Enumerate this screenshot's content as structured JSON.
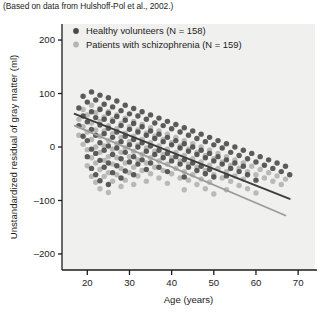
{
  "caption": "(Based on data from Hulshoff-Pol et al., 2002.)",
  "colors": {
    "healthy": "#4a4a4a",
    "patients": "#b4b4b4",
    "healthy_line": "#3d3d3d",
    "patients_line": "#9b9b9b",
    "axis": "#1c1c1c",
    "plot_background": "#f0f0ee",
    "page_background": "#ffffff"
  },
  "chart_data": {
    "type": "scatter",
    "title": "",
    "xlabel": "Age (years)",
    "ylabel": "Unstandardized residual of gray matter (ml)",
    "xlim": [
      14,
      74
    ],
    "ylim": [
      -230,
      230
    ],
    "xticks": [
      20,
      30,
      40,
      50,
      60,
      70
    ],
    "yticks": [
      200,
      100,
      0,
      -100,
      -200
    ],
    "xtick_labels": [
      "20",
      "30",
      "40",
      "50",
      "60",
      "70"
    ],
    "ytick_labels": [
      "200",
      "100",
      "0",
      "-100",
      "-200"
    ],
    "grid": false,
    "legend_position": "top-left",
    "series": [
      {
        "name": "Healthy volunteers (N = 158)",
        "color": "#4a4a4a",
        "marker": "circle",
        "n": 158,
        "trendline": {
          "x0": 17,
          "y0": 62,
          "x1": 68,
          "y1": -97
        },
        "points": [
          [
            18,
            73
          ],
          [
            18,
            40
          ],
          [
            19,
            95
          ],
          [
            19,
            58
          ],
          [
            19,
            20
          ],
          [
            20,
            84
          ],
          [
            20,
            47
          ],
          [
            20,
            12
          ],
          [
            20,
            -18
          ],
          [
            21,
            103
          ],
          [
            21,
            66
          ],
          [
            21,
            33
          ],
          [
            21,
            -4
          ],
          [
            21,
            -40
          ],
          [
            22,
            88
          ],
          [
            22,
            55
          ],
          [
            22,
            22
          ],
          [
            22,
            -12
          ],
          [
            22,
            -52
          ],
          [
            23,
            97
          ],
          [
            23,
            70
          ],
          [
            23,
            41
          ],
          [
            23,
            8
          ],
          [
            23,
            -25
          ],
          [
            23,
            -63
          ],
          [
            24,
            80
          ],
          [
            24,
            52
          ],
          [
            24,
            25
          ],
          [
            24,
            -6
          ],
          [
            24,
            -38
          ],
          [
            25,
            92
          ],
          [
            25,
            63
          ],
          [
            25,
            35
          ],
          [
            25,
            2
          ],
          [
            25,
            -30
          ],
          [
            25,
            -70
          ],
          [
            26,
            75
          ],
          [
            26,
            48
          ],
          [
            26,
            18
          ],
          [
            26,
            -14
          ],
          [
            26,
            -48
          ],
          [
            27,
            86
          ],
          [
            27,
            57
          ],
          [
            27,
            28
          ],
          [
            27,
            -2
          ],
          [
            27,
            -35
          ],
          [
            28,
            68
          ],
          [
            28,
            40
          ],
          [
            28,
            10
          ],
          [
            28,
            -22
          ],
          [
            28,
            -58
          ],
          [
            29,
            78
          ],
          [
            29,
            50
          ],
          [
            29,
            20
          ],
          [
            29,
            -10
          ],
          [
            29,
            -45
          ],
          [
            30,
            62
          ],
          [
            30,
            33
          ],
          [
            30,
            4
          ],
          [
            30,
            -28
          ],
          [
            31,
            72
          ],
          [
            31,
            44
          ],
          [
            31,
            14
          ],
          [
            31,
            -18
          ],
          [
            31,
            -52
          ],
          [
            32,
            58
          ],
          [
            32,
            28
          ],
          [
            32,
            0
          ],
          [
            32,
            -32
          ],
          [
            33,
            66
          ],
          [
            33,
            38
          ],
          [
            33,
            8
          ],
          [
            33,
            -24
          ],
          [
            34,
            52
          ],
          [
            34,
            22
          ],
          [
            34,
            -8
          ],
          [
            34,
            -42
          ],
          [
            35,
            60
          ],
          [
            35,
            30
          ],
          [
            35,
            2
          ],
          [
            35,
            -30
          ],
          [
            36,
            45
          ],
          [
            36,
            16
          ],
          [
            36,
            -14
          ],
          [
            37,
            54
          ],
          [
            37,
            24
          ],
          [
            37,
            -6
          ],
          [
            37,
            -38
          ],
          [
            38,
            40
          ],
          [
            38,
            10
          ],
          [
            38,
            -20
          ],
          [
            39,
            48
          ],
          [
            39,
            18
          ],
          [
            39,
            -12
          ],
          [
            39,
            -46
          ],
          [
            40,
            34
          ],
          [
            40,
            4
          ],
          [
            40,
            -26
          ],
          [
            41,
            42
          ],
          [
            41,
            12
          ],
          [
            41,
            -18
          ],
          [
            42,
            28
          ],
          [
            42,
            -2
          ],
          [
            42,
            -32
          ],
          [
            43,
            36
          ],
          [
            43,
            6
          ],
          [
            43,
            -24
          ],
          [
            43,
            -56
          ],
          [
            44,
            22
          ],
          [
            44,
            -8
          ],
          [
            44,
            -38
          ],
          [
            45,
            30
          ],
          [
            45,
            0
          ],
          [
            45,
            -30
          ],
          [
            46,
            16
          ],
          [
            46,
            -14
          ],
          [
            46,
            -44
          ],
          [
            47,
            24
          ],
          [
            47,
            -6
          ],
          [
            47,
            -36
          ],
          [
            48,
            10
          ],
          [
            48,
            -20
          ],
          [
            48,
            -50
          ],
          [
            49,
            18
          ],
          [
            49,
            -12
          ],
          [
            49,
            -42
          ],
          [
            50,
            4
          ],
          [
            50,
            -26
          ],
          [
            50,
            -56
          ],
          [
            51,
            12
          ],
          [
            51,
            -18
          ],
          [
            52,
            -2
          ],
          [
            52,
            -32
          ],
          [
            53,
            6
          ],
          [
            53,
            -24
          ],
          [
            53,
            -54
          ],
          [
            54,
            -10
          ],
          [
            54,
            -40
          ],
          [
            55,
            0
          ],
          [
            55,
            -30
          ],
          [
            56,
            -16
          ],
          [
            56,
            -46
          ],
          [
            57,
            -6
          ],
          [
            57,
            -36
          ],
          [
            58,
            -22
          ],
          [
            58,
            -52
          ],
          [
            59,
            -12
          ],
          [
            60,
            -28
          ],
          [
            60,
            -62
          ],
          [
            61,
            -18
          ],
          [
            62,
            -34
          ],
          [
            63,
            -24
          ],
          [
            64,
            -40
          ],
          [
            65,
            -30
          ],
          [
            66,
            -46
          ],
          [
            67,
            -36
          ],
          [
            68,
            -52
          ]
        ]
      },
      {
        "name": "Patients with schizophrenia (N = 159)",
        "color": "#b4b4b4",
        "marker": "circle",
        "n": 159,
        "trendline": {
          "x0": 17,
          "y0": 40,
          "x1": 67,
          "y1": -128
        },
        "points": [
          [
            18,
            52
          ],
          [
            18,
            22
          ],
          [
            19,
            70
          ],
          [
            19,
            38
          ],
          [
            19,
            5
          ],
          [
            20,
            60
          ],
          [
            20,
            28
          ],
          [
            20,
            -5
          ],
          [
            20,
            -35
          ],
          [
            21,
            78
          ],
          [
            21,
            45
          ],
          [
            21,
            14
          ],
          [
            21,
            -20
          ],
          [
            21,
            -55
          ],
          [
            22,
            64
          ],
          [
            22,
            32
          ],
          [
            22,
            0
          ],
          [
            22,
            -30
          ],
          [
            22,
            -66
          ],
          [
            23,
            72
          ],
          [
            23,
            48
          ],
          [
            23,
            20
          ],
          [
            23,
            -10
          ],
          [
            23,
            -42
          ],
          [
            23,
            -78
          ],
          [
            24,
            56
          ],
          [
            24,
            30
          ],
          [
            24,
            2
          ],
          [
            24,
            -25
          ],
          [
            24,
            -55
          ],
          [
            25,
            66
          ],
          [
            25,
            40
          ],
          [
            25,
            12
          ],
          [
            25,
            -18
          ],
          [
            25,
            -48
          ],
          [
            25,
            -85
          ],
          [
            26,
            52
          ],
          [
            26,
            25
          ],
          [
            26,
            -4
          ],
          [
            26,
            -32
          ],
          [
            26,
            -64
          ],
          [
            27,
            60
          ],
          [
            27,
            34
          ],
          [
            27,
            6
          ],
          [
            27,
            -20
          ],
          [
            27,
            -52
          ],
          [
            28,
            44
          ],
          [
            28,
            18
          ],
          [
            28,
            -10
          ],
          [
            28,
            -40
          ],
          [
            28,
            -74
          ],
          [
            29,
            54
          ],
          [
            29,
            26
          ],
          [
            29,
            -2
          ],
          [
            29,
            -30
          ],
          [
            29,
            -62
          ],
          [
            30,
            38
          ],
          [
            30,
            10
          ],
          [
            30,
            -18
          ],
          [
            30,
            -48
          ],
          [
            31,
            48
          ],
          [
            31,
            20
          ],
          [
            31,
            -8
          ],
          [
            31,
            -38
          ],
          [
            31,
            -70
          ],
          [
            32,
            32
          ],
          [
            32,
            4
          ],
          [
            32,
            -24
          ],
          [
            32,
            -54
          ],
          [
            33,
            42
          ],
          [
            33,
            14
          ],
          [
            33,
            -14
          ],
          [
            33,
            -44
          ],
          [
            34,
            26
          ],
          [
            34,
            -2
          ],
          [
            34,
            -30
          ],
          [
            34,
            -64
          ],
          [
            35,
            36
          ],
          [
            35,
            8
          ],
          [
            35,
            -20
          ],
          [
            35,
            -50
          ],
          [
            36,
            20
          ],
          [
            36,
            -8
          ],
          [
            36,
            -38
          ],
          [
            37,
            30
          ],
          [
            37,
            2
          ],
          [
            37,
            -26
          ],
          [
            37,
            -58
          ],
          [
            38,
            14
          ],
          [
            38,
            -14
          ],
          [
            38,
            -44
          ],
          [
            39,
            24
          ],
          [
            39,
            -4
          ],
          [
            39,
            -32
          ],
          [
            39,
            -68
          ],
          [
            40,
            8
          ],
          [
            40,
            -20
          ],
          [
            40,
            -50
          ],
          [
            41,
            18
          ],
          [
            41,
            -10
          ],
          [
            41,
            -40
          ],
          [
            42,
            2
          ],
          [
            42,
            -26
          ],
          [
            42,
            -58
          ],
          [
            43,
            12
          ],
          [
            43,
            -16
          ],
          [
            43,
            -46
          ],
          [
            43,
            -80
          ],
          [
            44,
            -4
          ],
          [
            44,
            -32
          ],
          [
            44,
            -62
          ],
          [
            45,
            6
          ],
          [
            45,
            -22
          ],
          [
            45,
            -52
          ],
          [
            46,
            -10
          ],
          [
            46,
            -38
          ],
          [
            46,
            -70
          ],
          [
            47,
            0
          ],
          [
            47,
            -28
          ],
          [
            47,
            -60
          ],
          [
            48,
            -16
          ],
          [
            48,
            -44
          ],
          [
            48,
            -78
          ],
          [
            49,
            -6
          ],
          [
            49,
            -34
          ],
          [
            49,
            -66
          ],
          [
            50,
            -22
          ],
          [
            50,
            -52
          ],
          [
            50,
            -88
          ],
          [
            51,
            -12
          ],
          [
            51,
            -40
          ],
          [
            52,
            -28
          ],
          [
            52,
            -58
          ],
          [
            53,
            -18
          ],
          [
            53,
            -46
          ],
          [
            53,
            -80
          ],
          [
            54,
            -34
          ],
          [
            54,
            -64
          ],
          [
            55,
            -24
          ],
          [
            55,
            -54
          ],
          [
            56,
            -40
          ],
          [
            56,
            -72
          ],
          [
            57,
            -30
          ],
          [
            57,
            -60
          ],
          [
            58,
            -46
          ],
          [
            58,
            -78
          ],
          [
            59,
            -36
          ],
          [
            60,
            -52
          ],
          [
            60,
            -86
          ],
          [
            61,
            -42
          ],
          [
            62,
            -58
          ],
          [
            63,
            -48
          ],
          [
            64,
            -64
          ],
          [
            65,
            -54
          ],
          [
            66,
            -70
          ],
          [
            67,
            -60
          ]
        ]
      }
    ]
  }
}
